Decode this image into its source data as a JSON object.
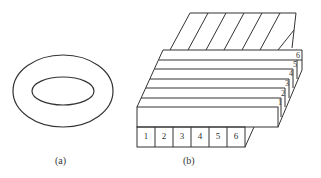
{
  "figure": {
    "panel_a": {
      "label": "(a)",
      "shape": "concentric ellipses (torus cross-section)"
    },
    "panel_b": {
      "label": "(b)",
      "front_numbers": [
        "1",
        "2",
        "3",
        "4",
        "5",
        "6"
      ],
      "side_numbers": [
        "1",
        "2",
        "3",
        "4",
        "5",
        "6"
      ]
    }
  },
  "colors": {
    "stroke": "#333333",
    "background": "#ffffff"
  }
}
